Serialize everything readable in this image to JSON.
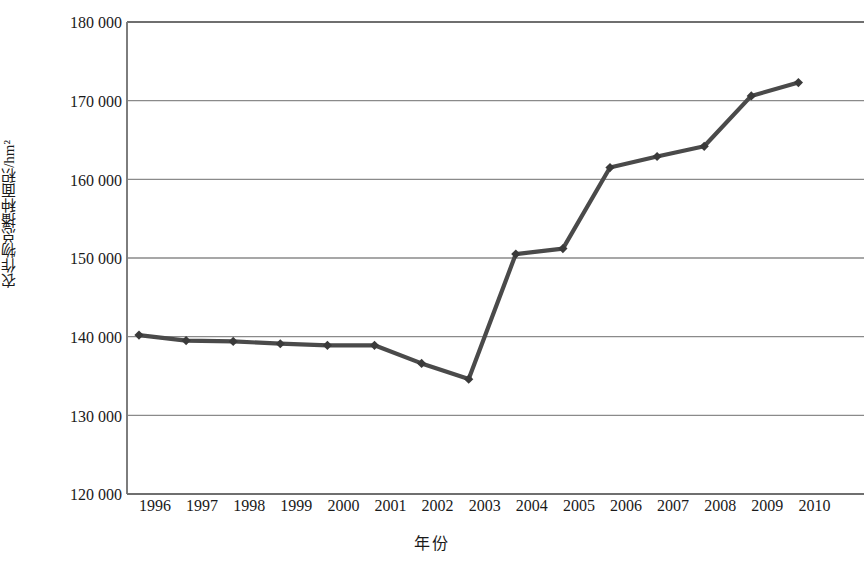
{
  "chart_data": {
    "type": "line",
    "title": "",
    "xlabel": "年份",
    "ylabel": "农作物总播种面积/hm²",
    "categories": [
      "1996",
      "1997",
      "1998",
      "1999",
      "2000",
      "2001",
      "2002",
      "2003",
      "2004",
      "2005",
      "2006",
      "2007",
      "2008",
      "2009",
      "2010"
    ],
    "x": [
      1996,
      1997,
      1998,
      1999,
      2000,
      2001,
      2002,
      2003,
      2004,
      2005,
      2006,
      2007,
      2008,
      2009,
      2010
    ],
    "values": [
      140200,
      139500,
      139400,
      139100,
      138900,
      138900,
      136600,
      134600,
      150500,
      151200,
      161500,
      162900,
      164200,
      170600,
      172300
    ],
    "series": [
      {
        "name": "农作物总播种面积",
        "values": [
          140200,
          139500,
          139400,
          139100,
          138900,
          138900,
          136600,
          134600,
          150500,
          151200,
          161500,
          162900,
          164200,
          170600,
          172300
        ]
      }
    ],
    "ylim": [
      120000,
      180000
    ],
    "ytick_labels": [
      "180 000",
      "170 000",
      "160 000",
      "150 000",
      "140 000",
      "130 000",
      "120 000"
    ],
    "yticks": [
      180000,
      170000,
      160000,
      150000,
      140000,
      130000,
      120000
    ],
    "xtick_labels": [
      "1996",
      "1997",
      "1998",
      "1999",
      "2000",
      "2001",
      "2002",
      "2003",
      "2004",
      "2005",
      "2006",
      "2007",
      "2008",
      "2009",
      "2010"
    ],
    "grid": true,
    "legend": "none",
    "line_color": "#4a4a4a",
    "marker": "diamond",
    "marker_color": "#3a3a3a",
    "axis_color": "#808080",
    "gridline_color": "#8a8a8a"
  }
}
